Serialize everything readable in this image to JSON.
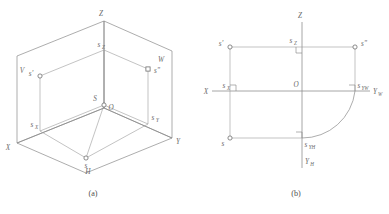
{
  "figure": {
    "captions": {
      "a": "(a)",
      "b": "(b)"
    },
    "stroke_color": "#8a8a8a",
    "label_color": "#6b6b6b",
    "background": "#ffffff"
  },
  "diagram_a": {
    "name": "axonometric-three-plane-projection",
    "axes": {
      "x": "X",
      "y": "Y",
      "z": "Z"
    },
    "planes": {
      "v": "V",
      "h": "H",
      "w": "W"
    },
    "origin": "O",
    "points": {
      "space_point": "S",
      "h_projection": "s",
      "v_projection": "s'",
      "w_projection": "s\""
    },
    "axis_traces": {
      "x_trace": "s",
      "x_trace_sub": "X",
      "y_trace": "s",
      "y_trace_sub": "Y",
      "z_trace": "s",
      "z_trace_sub": "Z"
    }
  },
  "diagram_b": {
    "name": "unfolded-orthographic-projection",
    "axes": {
      "x": "X",
      "z": "Z",
      "y_w": "Y",
      "y_w_sub": "W",
      "y_h": "Y",
      "y_h_sub": "H"
    },
    "origin": "O",
    "points": {
      "h_projection": "s",
      "v_projection": "s'",
      "w_projection": "s\""
    },
    "axis_traces": {
      "x_trace": "s",
      "x_trace_sub": "X",
      "z_trace": "s",
      "z_trace_sub": "Z",
      "yw_trace": "s",
      "yw_trace_sub": "YW",
      "yh_trace": "s",
      "yh_trace_sub": "YH"
    }
  }
}
